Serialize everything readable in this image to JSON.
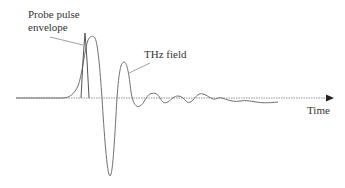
{
  "diagram": {
    "type": "waveform-schematic",
    "labels": {
      "probe_line1": "Probe pulse",
      "probe_line2": "envelope",
      "thz": "THz field",
      "time_axis": "Time"
    },
    "colors": {
      "curve": "#707070",
      "axis": "#777777",
      "text": "#333333",
      "background": "#ffffff"
    },
    "axis": {
      "style": "dotted",
      "arrow": true,
      "direction": "right"
    },
    "elements": [
      "time axis with arrow",
      "narrow probe pulse envelope spike near THz peak",
      "THz field single-cycle waveform: positive peak, deep negative trough, second positive peak, decaying oscillations"
    ]
  }
}
